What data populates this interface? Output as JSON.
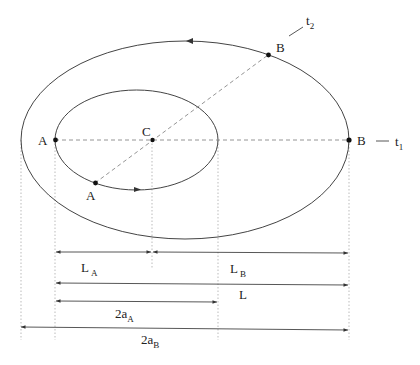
{
  "diagram": {
    "type": "orbital-transfer",
    "colors": {
      "stroke": "#333333",
      "dashed": "#888888",
      "dotted": "#aaaaaa",
      "background": "#ffffff"
    },
    "orbits": [
      {
        "name": "inner-orbit",
        "label": "A"
      },
      {
        "name": "outer-orbit",
        "label": "B"
      }
    ],
    "points": {
      "A_left": "A",
      "C_center": "C",
      "A_lower": "A",
      "B_upper": "B",
      "B_right": "B"
    },
    "time_labels": {
      "t1": {
        "base": "t",
        "sub": "1"
      },
      "t2": {
        "base": "t",
        "sub": "2"
      }
    },
    "dimensions": [
      {
        "id": "LA",
        "base": "L",
        "sub": "A"
      },
      {
        "id": "LB",
        "base": "L",
        "sub": "B"
      },
      {
        "id": "L",
        "base": "L",
        "sub": ""
      },
      {
        "id": "2aA",
        "base": "2a",
        "sub": "A"
      },
      {
        "id": "2aB",
        "base": "2a",
        "sub": "B"
      }
    ]
  }
}
